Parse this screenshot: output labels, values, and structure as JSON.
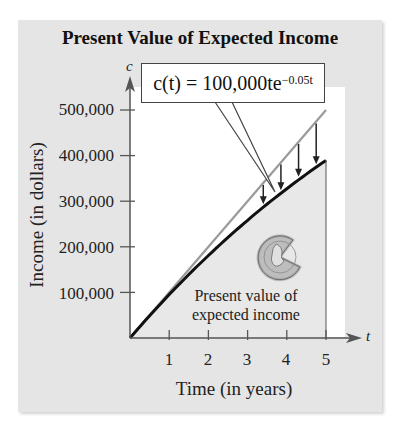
{
  "chart_data": {
    "type": "line",
    "title": "Present Value of Expected Income",
    "xlabel": "Time (in years)",
    "ylabel": "Income (in dollars)",
    "x_axis_letter": "t",
    "y_axis_letter": "c",
    "xlim": [
      0,
      5.3
    ],
    "ylim": [
      0,
      540000
    ],
    "x_ticks": [
      1,
      2,
      3,
      4,
      5
    ],
    "x_tick_labels": [
      "1",
      "2",
      "3",
      "4",
      "5"
    ],
    "y_ticks": [
      100000,
      200000,
      300000,
      400000,
      500000
    ],
    "y_tick_labels": [
      "100,000",
      "200,000",
      "300,000",
      "400,000",
      "500,000"
    ],
    "grid": false,
    "series": [
      {
        "name": "Expected income (undiscounted)",
        "style": "gray line",
        "color": "#9a9a9a",
        "x": [
          0,
          1,
          2,
          3,
          4,
          5
        ],
        "values": [
          0,
          100000,
          200000,
          300000,
          400000,
          500000
        ]
      },
      {
        "name": "Present value c(t) = 100,000te^(-0.05t)",
        "style": "black line, shaded area below",
        "color": "#111111",
        "x": [
          0,
          1,
          2,
          3,
          4,
          5
        ],
        "values": [
          0,
          95123,
          180967,
          258212,
          327492,
          389400
        ]
      }
    ],
    "annotations": {
      "callout_formula_prefix": "c(t) = 100,000te",
      "callout_formula_exponent": "−0.05t",
      "shaded_region_label_line1": "Present value of",
      "shaded_region_label_line2": "expected income",
      "arrow_positions_t": [
        3.4,
        3.85,
        4.3,
        4.75
      ],
      "icon": "coin with slice removed"
    }
  },
  "colors": {
    "panel_background": "#e5e5e5",
    "plot_background": "#ffffff",
    "shaded_area": "#e8e8e8",
    "gray_line": "#9a9a9a",
    "black_curve": "#111111"
  }
}
